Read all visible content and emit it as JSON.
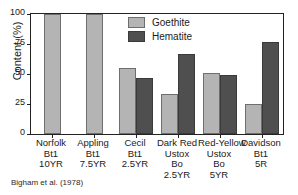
{
  "chart_data": {
    "type": "bar",
    "title": "",
    "xlabel": "",
    "ylabel": "Content (%)",
    "ylim": [
      0,
      100
    ],
    "yticks": [
      0,
      25,
      50,
      75,
      100
    ],
    "ytick_labels": [
      "0",
      "25",
      "50",
      "75",
      "100"
    ],
    "grid": false,
    "legend_position": "top-center",
    "categories": [
      "Norfolk Bt1 10YR",
      "Appling Bt1 7.5YR",
      "Cecil Bt1 2.5YR",
      "Dark Red Ustox Bo 2.5YR",
      "Red-Yellow Ustox Bo 5YR",
      "Davidson Bt1 5R"
    ],
    "category_lines": [
      [
        "Norfolk",
        "Bt1",
        "10YR"
      ],
      [
        "Appling",
        "Bt1",
        "7.5YR"
      ],
      [
        "Cecil",
        "Bt1",
        "2.5YR"
      ],
      [
        "Dark Red",
        "Ustox",
        "Bo",
        "2.5YR"
      ],
      [
        "Red-Yellow",
        "Ustox",
        "Bo",
        "5YR"
      ],
      [
        "Davidson",
        "Bt1",
        "5R"
      ]
    ],
    "series": [
      {
        "name": "Goethite",
        "color": "#b4b4b4",
        "values": [
          100,
          100,
          55,
          33,
          51,
          25
        ]
      },
      {
        "name": "Hematite",
        "color": "#4f4f4f",
        "values": [
          0,
          0,
          47,
          67,
          49,
          77
        ]
      }
    ],
    "annotations": [
      "Bigham et al. (1978)"
    ]
  },
  "legend": {
    "items": [
      {
        "label": "Goethite"
      },
      {
        "label": "Hematite"
      }
    ]
  },
  "citation": "Bigham et al. (1978)"
}
